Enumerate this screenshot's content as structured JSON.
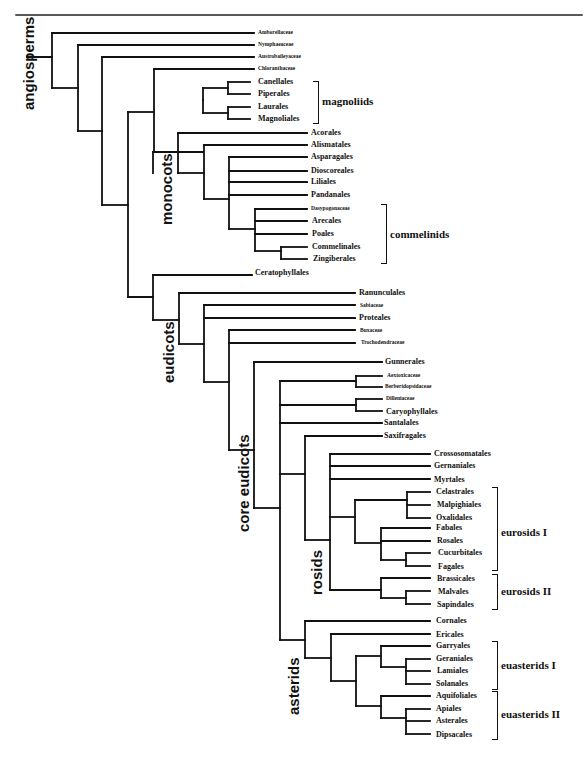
{
  "figure": {
    "type": "phylogenetic-tree"
  },
  "clades": [
    {
      "label": "angiosperms",
      "x": 21,
      "y": 110
    },
    {
      "label": "monocots",
      "x": 159,
      "y": 225
    },
    {
      "label": "eudicots",
      "x": 161,
      "y": 383
    },
    {
      "label": "core eudicots",
      "x": 236,
      "y": 532
    },
    {
      "label": "rosids",
      "x": 309,
      "y": 595
    },
    {
      "label": "asterids",
      "x": 286,
      "y": 715
    }
  ],
  "groups": [
    {
      "label": "magnoliids",
      "x": 322,
      "y": 101,
      "bracket_x": 313,
      "top": 81,
      "bottom": 122
    },
    {
      "label": "commelinids",
      "x": 390,
      "y": 234,
      "bracket_x": 381,
      "top": 204,
      "bottom": 262
    },
    {
      "label": "eurosids I",
      "x": 501,
      "y": 532,
      "bracket_x": 492,
      "top": 487,
      "bottom": 569
    },
    {
      "label": "eurosids II",
      "x": 501,
      "y": 591,
      "bracket_x": 492,
      "top": 574,
      "bottom": 608
    },
    {
      "label": "euasterids I",
      "x": 501,
      "y": 665,
      "bracket_x": 492,
      "top": 641,
      "bottom": 688
    },
    {
      "label": "euasterids II",
      "x": 501,
      "y": 714,
      "bracket_x": 492,
      "top": 691,
      "bottom": 738
    }
  ],
  "leaves": [
    {
      "label": "Amborellaceae",
      "x": 258,
      "y": 33,
      "size": "small"
    },
    {
      "label": "Nymphaeaceae",
      "x": 258,
      "y": 45,
      "size": "small"
    },
    {
      "label": "Austrobaileyaceae",
      "x": 258,
      "y": 57,
      "size": "small"
    },
    {
      "label": "Chloranthaceae",
      "x": 258,
      "y": 69,
      "size": "small"
    },
    {
      "label": "Canellales",
      "x": 258,
      "y": 82,
      "size": "big"
    },
    {
      "label": "Piperales",
      "x": 258,
      "y": 94,
      "size": "big"
    },
    {
      "label": "Laurales",
      "x": 258,
      "y": 107,
      "size": "big"
    },
    {
      "label": "Magnoliales",
      "x": 258,
      "y": 119,
      "size": "big"
    },
    {
      "label": "Acorales",
      "x": 311,
      "y": 133,
      "size": "big"
    },
    {
      "label": "Alismatales",
      "x": 311,
      "y": 145,
      "size": "big"
    },
    {
      "label": "Asparagales",
      "x": 311,
      "y": 157,
      "size": "big"
    },
    {
      "label": "Dioscoreales",
      "x": 311,
      "y": 171,
      "size": "big"
    },
    {
      "label": "Liliales",
      "x": 311,
      "y": 182,
      "size": "big"
    },
    {
      "label": "Pandanales",
      "x": 311,
      "y": 195,
      "size": "big"
    },
    {
      "label": "Dasypogonaceae",
      "x": 311,
      "y": 209,
      "size": "small"
    },
    {
      "label": "Arecales",
      "x": 312,
      "y": 221,
      "size": "big"
    },
    {
      "label": "Poales",
      "x": 312,
      "y": 234,
      "size": "big"
    },
    {
      "label": "Commelinales",
      "x": 312,
      "y": 247,
      "size": "big"
    },
    {
      "label": "Zingiberales",
      "x": 313,
      "y": 259,
      "size": "big"
    },
    {
      "label": "Ceratophyllales",
      "x": 255,
      "y": 273,
      "size": "big"
    },
    {
      "label": "Ranunculales",
      "x": 359,
      "y": 293,
      "size": "big"
    },
    {
      "label": "Sabiaceae",
      "x": 360,
      "y": 306,
      "size": "small"
    },
    {
      "label": "Proteales",
      "x": 359,
      "y": 318,
      "size": "big"
    },
    {
      "label": "Buxaceae",
      "x": 360,
      "y": 331,
      "size": "small"
    },
    {
      "label": "Trochodendraceae",
      "x": 361,
      "y": 343,
      "size": "small"
    },
    {
      "label": "Gunnerales",
      "x": 385,
      "y": 362,
      "size": "big"
    },
    {
      "label": "Aextoxicaceae",
      "x": 387,
      "y": 376,
      "size": "small"
    },
    {
      "label": "Berberidopsidaceae",
      "x": 385,
      "y": 387,
      "size": "small"
    },
    {
      "label": "Dilleniaceae",
      "x": 386,
      "y": 399,
      "size": "small"
    },
    {
      "label": "Caryophyllales",
      "x": 386,
      "y": 412,
      "size": "big"
    },
    {
      "label": "Santalales",
      "x": 384,
      "y": 423,
      "size": "big"
    },
    {
      "label": "Saxifragales",
      "x": 384,
      "y": 436,
      "size": "big"
    },
    {
      "label": "Crossosomatales",
      "x": 434,
      "y": 454,
      "size": "big"
    },
    {
      "label": "Gernaniales",
      "x": 434,
      "y": 466,
      "size": "big"
    },
    {
      "label": "Myrtales",
      "x": 434,
      "y": 480,
      "size": "big"
    },
    {
      "label": "Celastrales",
      "x": 436,
      "y": 492,
      "size": "big"
    },
    {
      "label": "Malpighiales",
      "x": 437,
      "y": 505,
      "size": "big"
    },
    {
      "label": "Oxalidales",
      "x": 436,
      "y": 518,
      "size": "big"
    },
    {
      "label": "Fabales",
      "x": 436,
      "y": 528,
      "size": "big"
    },
    {
      "label": "Rosales",
      "x": 437,
      "y": 541,
      "size": "big"
    },
    {
      "label": "Cucurbitales",
      "x": 438,
      "y": 553,
      "size": "big"
    },
    {
      "label": "Fagales",
      "x": 438,
      "y": 567,
      "size": "big"
    },
    {
      "label": "Brassicales",
      "x": 437,
      "y": 579,
      "size": "big"
    },
    {
      "label": "Malvales",
      "x": 438,
      "y": 592,
      "size": "big"
    },
    {
      "label": "Sapindales",
      "x": 437,
      "y": 605,
      "size": "big"
    },
    {
      "label": "Cornales",
      "x": 436,
      "y": 621,
      "size": "big"
    },
    {
      "label": "Ericales",
      "x": 436,
      "y": 635,
      "size": "big"
    },
    {
      "label": "Garryales",
      "x": 436,
      "y": 646,
      "size": "big"
    },
    {
      "label": "Geraniales",
      "x": 436,
      "y": 659,
      "size": "big"
    },
    {
      "label": "Lamiales",
      "x": 437,
      "y": 671,
      "size": "big"
    },
    {
      "label": "Solanales",
      "x": 436,
      "y": 684,
      "size": "big"
    },
    {
      "label": "Aquifoliales",
      "x": 436,
      "y": 696,
      "size": "big"
    },
    {
      "label": "Apiales",
      "x": 436,
      "y": 709,
      "size": "big"
    },
    {
      "label": "Asterales",
      "x": 436,
      "y": 721,
      "size": "big"
    },
    {
      "label": "Dipsacales",
      "x": 436,
      "y": 735,
      "size": "big"
    }
  ],
  "edges": [
    [
      16,
      15,
      582,
      15
    ],
    [
      27,
      57,
      52,
      57
    ],
    [
      52,
      33,
      52,
      88
    ],
    [
      52,
      33,
      254,
      33
    ],
    [
      52,
      88,
      78,
      88
    ],
    [
      78,
      45,
      78,
      131
    ],
    [
      78,
      45,
      254,
      45
    ],
    [
      78,
      131,
      102,
      131
    ],
    [
      102,
      57,
      102,
      205
    ],
    [
      102,
      57,
      254,
      57
    ],
    [
      102,
      205,
      128,
      205
    ],
    [
      128,
      112,
      128,
      297
    ],
    [
      128,
      112,
      154,
      112
    ],
    [
      154,
      69,
      154,
      152
    ],
    [
      154,
      69,
      254,
      69
    ],
    [
      154,
      152,
      203,
      152
    ],
    [
      203,
      100,
      203,
      100
    ],
    [
      203,
      88,
      203,
      113
    ],
    [
      203,
      88,
      228,
      88
    ],
    [
      203,
      113,
      228,
      113
    ],
    [
      228,
      82,
      228,
      94
    ],
    [
      228,
      82,
      250,
      82
    ],
    [
      228,
      94,
      250,
      94
    ],
    [
      228,
      107,
      228,
      119
    ],
    [
      228,
      107,
      250,
      107
    ],
    [
      228,
      119,
      250,
      119
    ],
    [
      128,
      297,
      153,
      297
    ],
    [
      153,
      152,
      153,
      173
    ],
    [
      153,
      152,
      178,
      152
    ],
    [
      178,
      133,
      178,
      173
    ],
    [
      178,
      133,
      307,
      133
    ],
    [
      178,
      173,
      204,
      173
    ],
    [
      204,
      145,
      204,
      199
    ],
    [
      204,
      145,
      307,
      145
    ],
    [
      204,
      199,
      229,
      199
    ],
    [
      229,
      157,
      229,
      229
    ],
    [
      229,
      157,
      307,
      157
    ],
    [
      229,
      171,
      307,
      171
    ],
    [
      229,
      182,
      307,
      182
    ],
    [
      229,
      195,
      307,
      195
    ],
    [
      229,
      229,
      255,
      229
    ],
    [
      255,
      209,
      255,
      251
    ],
    [
      255,
      209,
      307,
      209
    ],
    [
      255,
      221,
      307,
      221
    ],
    [
      255,
      234,
      307,
      234
    ],
    [
      255,
      251,
      281,
      251
    ],
    [
      281,
      247,
      281,
      259
    ],
    [
      281,
      247,
      307,
      247
    ],
    [
      281,
      259,
      307,
      259
    ],
    [
      128,
      297,
      153,
      297
    ],
    [
      153,
      275,
      153,
      320
    ],
    [
      153,
      275,
      252,
      275
    ],
    [
      153,
      320,
      179,
      320
    ],
    [
      179,
      293,
      179,
      344
    ],
    [
      179,
      293,
      355,
      293
    ],
    [
      179,
      344,
      204,
      344
    ],
    [
      204,
      305,
      204,
      382
    ],
    [
      204,
      305,
      355,
      305
    ],
    [
      204,
      318,
      355,
      318
    ],
    [
      204,
      382,
      229,
      382
    ],
    [
      229,
      330,
      229,
      450
    ],
    [
      229,
      330,
      355,
      330
    ],
    [
      229,
      343,
      355,
      343
    ],
    [
      229,
      450,
      254,
      450
    ],
    [
      254,
      362,
      254,
      508
    ],
    [
      254,
      362,
      382,
      362
    ],
    [
      254,
      508,
      280,
      508
    ],
    [
      280,
      381,
      280,
      640
    ],
    [
      280,
      381,
      356,
      381
    ],
    [
      356,
      376,
      356,
      387
    ],
    [
      356,
      376,
      382,
      376
    ],
    [
      356,
      387,
      382,
      387
    ],
    [
      280,
      405,
      356,
      405
    ],
    [
      356,
      399,
      356,
      411
    ],
    [
      356,
      399,
      382,
      399
    ],
    [
      356,
      411,
      382,
      411
    ],
    [
      280,
      423,
      382,
      423
    ],
    [
      280,
      474,
      305,
      474
    ],
    [
      305,
      436,
      305,
      540
    ],
    [
      305,
      436,
      382,
      436
    ],
    [
      305,
      540,
      330,
      540
    ],
    [
      330,
      454,
      330,
      590
    ],
    [
      330,
      454,
      430,
      454
    ],
    [
      330,
      466,
      430,
      466
    ],
    [
      330,
      479,
      430,
      479
    ],
    [
      330,
      517,
      355,
      517
    ],
    [
      355,
      500,
      355,
      543
    ],
    [
      355,
      500,
      407,
      500
    ],
    [
      407,
      492,
      407,
      518
    ],
    [
      407,
      492,
      430,
      492
    ],
    [
      407,
      505,
      430,
      505
    ],
    [
      407,
      518,
      430,
      518
    ],
    [
      355,
      543,
      381,
      543
    ],
    [
      381,
      528,
      381,
      560
    ],
    [
      381,
      528,
      430,
      528
    ],
    [
      381,
      541,
      430,
      541
    ],
    [
      381,
      560,
      406,
      560
    ],
    [
      406,
      553,
      406,
      566
    ],
    [
      406,
      553,
      430,
      553
    ],
    [
      406,
      566,
      430,
      566
    ],
    [
      330,
      590,
      381,
      590
    ],
    [
      381,
      578,
      381,
      598
    ],
    [
      381,
      578,
      430,
      578
    ],
    [
      381,
      598,
      406,
      598
    ],
    [
      406,
      591,
      406,
      604
    ],
    [
      406,
      591,
      430,
      591
    ],
    [
      406,
      604,
      430,
      604
    ],
    [
      280,
      640,
      305,
      640
    ],
    [
      305,
      621,
      305,
      658
    ],
    [
      305,
      621,
      430,
      621
    ],
    [
      305,
      658,
      331,
      658
    ],
    [
      331,
      634,
      331,
      681
    ],
    [
      331,
      634,
      430,
      634
    ],
    [
      331,
      681,
      356,
      681
    ],
    [
      356,
      656,
      356,
      706
    ],
    [
      356,
      656,
      381,
      656
    ],
    [
      381,
      646,
      381,
      667
    ],
    [
      381,
      646,
      430,
      646
    ],
    [
      381,
      667,
      406,
      667
    ],
    [
      406,
      659,
      406,
      684
    ],
    [
      406,
      659,
      430,
      659
    ],
    [
      406,
      671,
      430,
      671
    ],
    [
      406,
      684,
      430,
      684
    ],
    [
      356,
      706,
      381,
      706
    ],
    [
      381,
      696,
      381,
      718
    ],
    [
      381,
      696,
      430,
      696
    ],
    [
      381,
      718,
      406,
      718
    ],
    [
      406,
      709,
      406,
      734
    ],
    [
      406,
      709,
      430,
      709
    ],
    [
      406,
      721,
      430,
      721
    ],
    [
      406,
      734,
      430,
      734
    ]
  ]
}
